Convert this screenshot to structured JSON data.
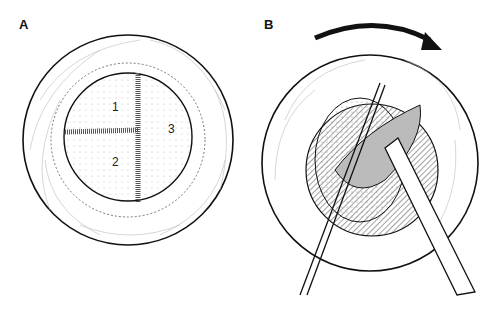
{
  "panels": [
    {
      "label": "A",
      "description": "Eye with circular graft divided by sutures into regions",
      "regions": [
        "1",
        "2",
        "3"
      ]
    },
    {
      "label": "B",
      "description": "Eye with instruments rotating graft tissue; rotation arrow clockwise",
      "arrow": "clockwise-rotation-arrow"
    }
  ],
  "colors": {
    "ink": "#111111",
    "background": "#ffffff",
    "stipple": "#999999"
  }
}
